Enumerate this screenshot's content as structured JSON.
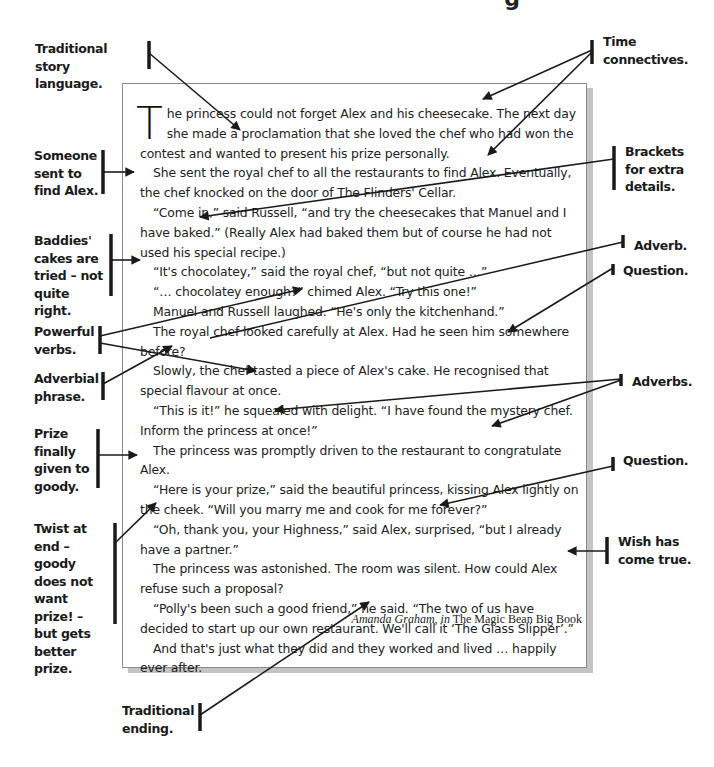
{
  "page": {
    "title_fragment": "g"
  },
  "story": {
    "drop_cap": "T",
    "paragraphs": [
      "he princess could not forget Alex and his cheesecake. The next day she made a proclamation that she loved the chef who had won the contest and wanted to present his prize personally.",
      "She sent the royal chef to all the restaurants to find Alex. Eventually, the chef knocked on the door of The Flinders' Cellar.",
      "“Come in,” said Russell, “and try the cheesecakes that Manuel and I have baked.” (Really Alex had baked them but of course he had not used his special recipe.)",
      "“It's chocolatey,” said the royal chef, “but not quite …”",
      "“… chocolatey enough?” chimed Alex. “Try this one!”",
      "Manuel and Russell laughed. “He's only the kitchenhand.”",
      "The royal chef looked carefully at Alex. Had he seen him somewhere before?",
      "Slowly, the chef tasted a piece of Alex's cake. He recognised that special flavour at once.",
      "“This is it!” he squealed with delight. “I have found the mystery chef. Inform the princess at once!”",
      "The princess was promptly driven to the restaurant to congratulate Alex.",
      "“Here is your prize,” said the beautiful princess, kissing Alex lightly on the cheek. “Will you marry me and cook for me forever?”",
      "“Oh, thank you, your Highness,” said Alex, surprised, “but I already have a partner.”",
      "The princess was astonished. The room was silent. How could Alex refuse such a proposal?",
      "“Polly's been such a good friend,” he said. “The two of us have decided to start up our own restaurant. We'll call it ‘The Glass Slipper’.”",
      "And that's just what they did and they worked and lived … happily ever after."
    ],
    "credit_author": "Amanda Graham, in",
    "credit_book": " The Magic Bean Big Book"
  },
  "annotations": {
    "left": [
      "Traditional story language.",
      "Someone sent to find Alex.",
      "Baddies' cakes are tried – not quite right.",
      "Powerful verbs.",
      "Adverbial phrase.",
      "Prize finally given to goody.",
      "Twist at end – goody does not want prize! – but gets better prize.",
      "Traditional ending."
    ],
    "right": [
      "Time connectives.",
      "Brackets for extra details.",
      "Adverb.",
      "Question.",
      "Adverbs.",
      "Question.",
      "Wish has come true."
    ]
  },
  "colors": {
    "text": "#222222",
    "annotation": "#1a1a1a",
    "box_border": "#8a8a8a",
    "box_shadow": "#c4c4c4"
  }
}
